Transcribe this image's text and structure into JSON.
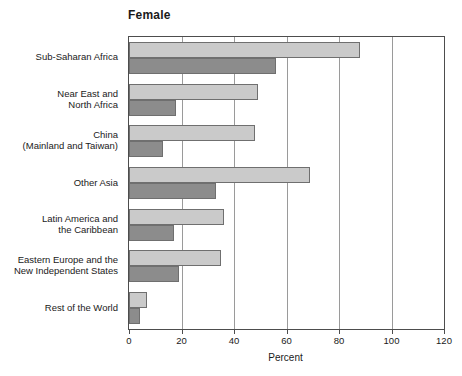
{
  "chart_data": {
    "type": "bar",
    "orientation": "horizontal",
    "title": "Female",
    "subtitle": "",
    "xlabel": "Percent",
    "ylabel": "",
    "xlim": [
      0,
      120
    ],
    "xticks": [
      0,
      20,
      40,
      60,
      80,
      100,
      120
    ],
    "xticklabels": [
      "0",
      "20",
      "40",
      "60",
      "80",
      "100",
      "120"
    ],
    "grid": "vertical",
    "legend": "none",
    "categories": [
      "Sub-Saharan Africa",
      "Near East and\nNorth Africa",
      "China\n(Mainland and Taiwan)",
      "Other Asia",
      "Latin America and\nthe Caribbean",
      "Eastern Europe and the\nNew Independent States",
      "Rest of the World"
    ],
    "series": [
      {
        "name": "series-a",
        "color": "#cacaca",
        "values": [
          88,
          49,
          48,
          69,
          36,
          35,
          7
        ]
      },
      {
        "name": "series-b",
        "color": "#8c8c8c",
        "values": [
          56,
          18,
          13,
          33,
          17,
          19,
          4
        ]
      }
    ]
  },
  "colors": {
    "series_a": "#cacaca",
    "series_b": "#8c8c8c",
    "bar_outline": "#6f6f6f",
    "axis": "#4d4d4d",
    "gridline": "#9a9a9a",
    "text": "#1a1a1a",
    "background": "#ffffff"
  }
}
